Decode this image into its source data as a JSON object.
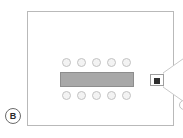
{
  "figure": {
    "panel_label": "B",
    "caption": "",
    "background_color": "#ffffff"
  },
  "room": {
    "name": "meeting-room",
    "outline_color": "#b9b9b9",
    "fill_color": "#ffffff"
  },
  "table": {
    "label": "",
    "fill_color": "#a8a8a8",
    "border_color": "#8d8d8d"
  },
  "chairs": {
    "count_total": 10,
    "fill_color": "#f3f3f3",
    "border_color": "#c2c2c2",
    "rows": [
      {
        "side": "top",
        "count": 5,
        "seats": [
          "",
          "",
          "",
          "",
          ""
        ]
      },
      {
        "side": "bottom",
        "count": 5,
        "seats": [
          "",
          "",
          "",
          "",
          ""
        ]
      }
    ]
  },
  "projector": {
    "label": "",
    "body_color": "#ffffff",
    "lens_color": "#2f2f2f"
  },
  "light_cone": {
    "label": "",
    "stroke_color": "#c9c9c9",
    "fill_color": "#ffffff"
  },
  "screen": {
    "label": "",
    "color": "#3c3c3c"
  },
  "presenter": {
    "label": "",
    "fill_color": "#ffffff",
    "border_color": "#c2c2c2"
  }
}
